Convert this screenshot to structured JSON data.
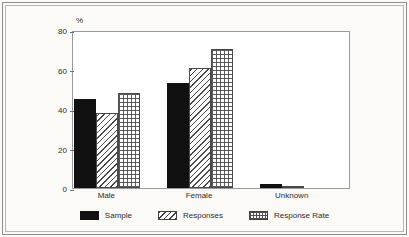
{
  "chart_data": {
    "type": "bar",
    "title": "",
    "subtitle": "",
    "xlabel": "",
    "ylabel": "%",
    "ylim": [
      0,
      80
    ],
    "yticks": [
      0,
      20,
      40,
      60,
      80
    ],
    "ytick_labels": [
      "0",
      "20",
      "40",
      "60",
      "80"
    ],
    "grid": false,
    "legend_position": "bottom-center",
    "categories": [
      "Male",
      "Female",
      "Unknown"
    ],
    "series": [
      {
        "name": "Sample",
        "pattern": "solid-black",
        "values": [
          45,
          53,
          2
        ]
      },
      {
        "name": "Responses",
        "pattern": "diagonal-hatch",
        "values": [
          38,
          61,
          1
        ]
      },
      {
        "name": "Response Rate",
        "pattern": "crosshatch-grid",
        "values": [
          48,
          70.5,
          0
        ]
      }
    ]
  },
  "axis": {
    "unit_label": "%"
  },
  "legend": {
    "items": [
      {
        "label": "Sample"
      },
      {
        "label": "Responses"
      },
      {
        "label": "Response Rate"
      }
    ]
  },
  "colors": {
    "sample": "#111111",
    "hatch": "#4a4a4a",
    "grid": "#5a5a5a",
    "axis": "#9a9a9a",
    "text": "#2b2b2b",
    "page": "#fbfaf7",
    "plot_background": "#ffffff"
  }
}
